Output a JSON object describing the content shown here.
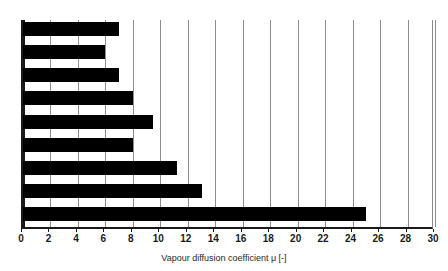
{
  "chart_data": {
    "type": "bar",
    "orientation": "horizontal",
    "title": "",
    "subtitle": "",
    "xlabel": "Vapour diffusion coefficient μ [-]",
    "ylabel": "",
    "xlim": [
      0,
      30
    ],
    "xticks": [
      0,
      2,
      4,
      6,
      8,
      10,
      12,
      14,
      16,
      18,
      20,
      22,
      24,
      26,
      28,
      30
    ],
    "xtick_labels": [
      "0",
      "2",
      "4",
      "6",
      "8",
      "10",
      "12",
      "14",
      "16",
      "18",
      "20",
      "22",
      "24",
      "26",
      "28",
      "30"
    ],
    "grid": true,
    "grid_axis": "x",
    "legend": false,
    "categories": [
      "",
      "",
      "",
      "",
      "",
      "",
      "",
      "",
      ""
    ],
    "values": [
      7,
      6,
      7,
      8,
      9.5,
      8,
      11.2,
      13,
      25
    ],
    "bar_color": "#000000",
    "grid_color": "#8e8e8e",
    "axis_color": "#1a1a1a",
    "background": "#ffffff"
  },
  "axis": {
    "x_title": "Vapour diffusion coefficient μ [-]"
  }
}
